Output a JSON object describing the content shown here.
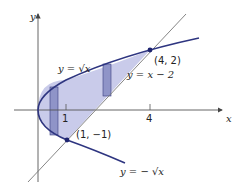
{
  "diagram": {
    "title": "",
    "axes": {
      "x_label": "x",
      "y_label": "y",
      "ticks": [
        {
          "value": 1,
          "label": "1"
        },
        {
          "value": 4,
          "label": "4"
        }
      ]
    },
    "curves": [
      {
        "name": "upper-branch",
        "equation_label": "y = √x"
      },
      {
        "name": "lower-branch",
        "equation_label": "y = − √x"
      },
      {
        "name": "line",
        "equation_label": "y = x − 2"
      }
    ],
    "points": [
      {
        "label": "(4, 2)",
        "x": 4,
        "y": 2
      },
      {
        "label": "(1, −1)",
        "x": 1,
        "y": -1
      }
    ],
    "colors": {
      "curve": "#2e3580",
      "shade": "#c5c8e8",
      "rect": "#8a8fc4",
      "axis": "#555555",
      "line": "#666666"
    }
  }
}
